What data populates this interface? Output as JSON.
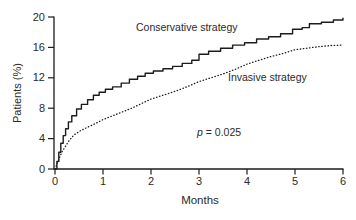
{
  "figure": {
    "background": "#ffffff",
    "text_color": "#2a2a2a",
    "axis_color": "#1c1c1c"
  },
  "chart_data": {
    "type": "line",
    "title": "",
    "xlabel": "Months",
    "ylabel": "Patients (%)",
    "xlim": [
      0,
      6
    ],
    "ylim": [
      0,
      20
    ],
    "x_ticks": [
      0,
      1,
      2,
      3,
      4,
      5,
      6
    ],
    "y_ticks": [
      0,
      4,
      8,
      12,
      16,
      20
    ],
    "grid": false,
    "legend_position": "inline-labels",
    "annotation": {
      "var": "p",
      "rest": " = 0.025"
    },
    "series": [
      {
        "name": "Conservative strategy",
        "line_style": "solid",
        "interpolation": "step-post",
        "color": "#1c1c1c",
        "points_months_percent": [
          [
            0,
            0
          ],
          [
            0.04,
            1.0
          ],
          [
            0.08,
            2.2
          ],
          [
            0.12,
            3.4
          ],
          [
            0.17,
            4.4
          ],
          [
            0.22,
            5.3
          ],
          [
            0.28,
            6.2
          ],
          [
            0.35,
            7.0
          ],
          [
            0.45,
            7.9
          ],
          [
            0.55,
            8.5
          ],
          [
            0.68,
            9.1
          ],
          [
            0.8,
            9.7
          ],
          [
            0.92,
            10.1
          ],
          [
            1.05,
            10.5
          ],
          [
            1.2,
            10.8
          ],
          [
            1.38,
            11.3
          ],
          [
            1.55,
            11.8
          ],
          [
            1.72,
            12.2
          ],
          [
            1.88,
            12.6
          ],
          [
            2.05,
            12.9
          ],
          [
            2.25,
            13.2
          ],
          [
            2.45,
            13.5
          ],
          [
            2.65,
            13.9
          ],
          [
            2.85,
            14.3
          ],
          [
            3.0,
            15.1
          ],
          [
            3.2,
            15.5
          ],
          [
            3.45,
            15.9
          ],
          [
            3.7,
            16.3
          ],
          [
            3.95,
            16.6
          ],
          [
            4.2,
            17.1
          ],
          [
            4.45,
            17.4
          ],
          [
            4.7,
            17.8
          ],
          [
            4.95,
            18.4
          ],
          [
            5.15,
            18.6
          ],
          [
            5.3,
            19.1
          ],
          [
            5.55,
            19.3
          ],
          [
            5.8,
            19.6
          ],
          [
            6.0,
            19.9
          ]
        ]
      },
      {
        "name": "Invasive strategy",
        "line_style": "dotted",
        "interpolation": "linear",
        "color": "#1c1c1c",
        "points_months_percent": [
          [
            0,
            0
          ],
          [
            0.05,
            0.8
          ],
          [
            0.1,
            1.6
          ],
          [
            0.15,
            2.3
          ],
          [
            0.22,
            3.0
          ],
          [
            0.3,
            3.8
          ],
          [
            0.4,
            4.5
          ],
          [
            0.52,
            5.0
          ],
          [
            0.68,
            5.5
          ],
          [
            0.85,
            6.0
          ],
          [
            1.0,
            6.5
          ],
          [
            1.2,
            7.0
          ],
          [
            1.4,
            7.5
          ],
          [
            1.6,
            8.0
          ],
          [
            1.8,
            8.6
          ],
          [
            2.0,
            9.2
          ],
          [
            2.2,
            9.6
          ],
          [
            2.4,
            10.0
          ],
          [
            2.62,
            10.5
          ],
          [
            2.82,
            11.0
          ],
          [
            3.0,
            11.5
          ],
          [
            3.25,
            12.0
          ],
          [
            3.5,
            12.5
          ],
          [
            3.75,
            13.1
          ],
          [
            4.0,
            13.8
          ],
          [
            4.25,
            14.3
          ],
          [
            4.5,
            14.8
          ],
          [
            4.75,
            15.2
          ],
          [
            5.0,
            15.7
          ],
          [
            5.25,
            15.9
          ],
          [
            5.5,
            16.1
          ],
          [
            5.75,
            16.25
          ],
          [
            6.0,
            16.3
          ]
        ]
      }
    ]
  }
}
